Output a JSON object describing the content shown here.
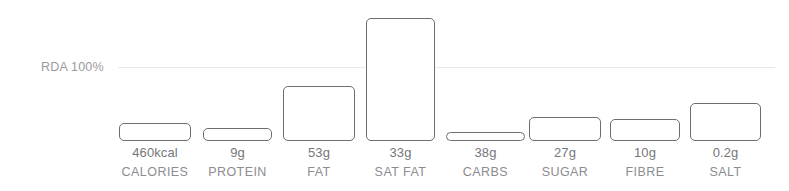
{
  "chart": {
    "type": "bar",
    "background_color": "#ffffff",
    "bar_stroke_color": "#6e6e72",
    "gridline_color": "#e9e9ec",
    "value_text_color": "#76767a",
    "category_text_color": "#8c8c90",
    "reference_label_color": "#9a9a9e"
  },
  "reference": {
    "label": "RDA 100%",
    "value": 100,
    "unit": "%"
  },
  "chart_data": {
    "type": "bar",
    "title": "",
    "subtitle": "",
    "xlabel": "",
    "ylabel": "",
    "grid": false,
    "legend": "none",
    "reference_line": {
      "label": "RDA 100%",
      "value": 100
    },
    "ylim": [
      0,
      180
    ],
    "categories": [
      "CALORIES",
      "PROTEIN",
      "FAT",
      "SAT FAT",
      "CARBS",
      "SUGAR",
      "FIBRE",
      "SALT"
    ],
    "value_labels": [
      "460kcal",
      "9g",
      "53g",
      "33g",
      "38g",
      "27g",
      "10g",
      "0.2g"
    ],
    "amounts": [
      460,
      9,
      53,
      33,
      38,
      27,
      10,
      0.2
    ],
    "units": [
      "kcal",
      "g",
      "g",
      "g",
      "g",
      "g",
      "g",
      "g"
    ],
    "values": [
      25,
      18,
      75,
      168,
      12,
      33,
      30,
      52
    ]
  },
  "bars": [
    {
      "category": "CALORIES",
      "value_label": "460kcal",
      "percent_rda": 25,
      "x": 119,
      "width": 72,
      "top": 123
    },
    {
      "category": "PROTEIN",
      "value_label": "9g",
      "percent_rda": 18,
      "x": 203,
      "width": 69,
      "top": 128
    },
    {
      "category": "FAT",
      "value_label": "53g",
      "percent_rda": 75,
      "x": 283,
      "width": 72,
      "top": 86
    },
    {
      "category": "SAT FAT",
      "value_label": "33g",
      "percent_rda": 168,
      "x": 366,
      "width": 69,
      "top": 18
    },
    {
      "category": "CARBS",
      "value_label": "38g",
      "percent_rda": 12,
      "x": 446,
      "width": 79,
      "top": 132
    },
    {
      "category": "SUGAR",
      "value_label": "27g",
      "percent_rda": 33,
      "x": 529,
      "width": 72,
      "top": 117
    },
    {
      "category": "FIBRE",
      "value_label": "10g",
      "percent_rda": 30,
      "x": 610,
      "width": 70,
      "top": 119
    },
    {
      "category": "SALT",
      "value_label": "0.2g",
      "percent_rda": 52,
      "x": 690,
      "width": 71,
      "top": 103
    }
  ],
  "layout": {
    "baseline_y": 141,
    "rda_line_y": 67,
    "rda_line_x": 118,
    "rda_line_width": 657
  }
}
